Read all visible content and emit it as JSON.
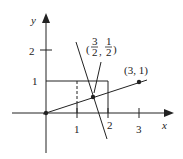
{
  "diagram": {
    "axes": {
      "x_label": "x",
      "y_label": "y",
      "x_ticks": [
        "1",
        "2",
        "3"
      ],
      "y_ticks": [
        "1",
        "2"
      ]
    },
    "points": [
      {
        "name": "origin",
        "label": ""
      },
      {
        "name": "point-3-1",
        "label": "(3, 1)"
      },
      {
        "name": "intersection",
        "label_num1": "3",
        "label_den1": "2",
        "label_num2": "1",
        "label_den2": "2"
      }
    ],
    "colors": {
      "ink": "#222222",
      "background": "#ffffff"
    }
  }
}
